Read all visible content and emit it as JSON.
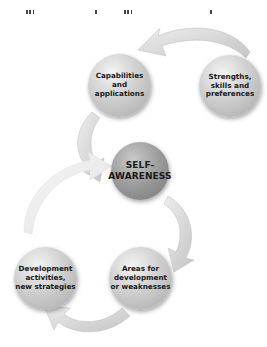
{
  "diagram": {
    "type": "cycle",
    "center": {
      "label": "SELF-\nAWARENESS",
      "line1": "SELF-",
      "line2": "AWARENESS"
    },
    "nodes": [
      {
        "id": "strengths",
        "lines": [
          "Strengths,",
          "skills and",
          "preferences"
        ]
      },
      {
        "id": "capabilities",
        "lines": [
          "Capabilities",
          "and",
          "applications"
        ]
      },
      {
        "id": "areas",
        "lines": [
          "Areas for",
          "development",
          "or weaknesses"
        ]
      },
      {
        "id": "development",
        "lines": [
          "Development",
          "activities,",
          "new strategies"
        ]
      }
    ],
    "flow": [
      "Strengths, skills and preferences -> Capabilities and applications",
      "Capabilities and applications -> SELF-AWARENESS",
      "SELF-AWARENESS -> Areas for development or weaknesses",
      "Areas for development or weaknesses -> Development activities, new strategies",
      "Development activities, new strategies -> SELF-AWARENESS"
    ],
    "colors": {
      "node_light": "#c8c8c8",
      "node_dark": "#8f8f8f",
      "arrow": "#d6d6d6",
      "arrow_light": "#ececec",
      "text": "#1a1a1a"
    }
  }
}
